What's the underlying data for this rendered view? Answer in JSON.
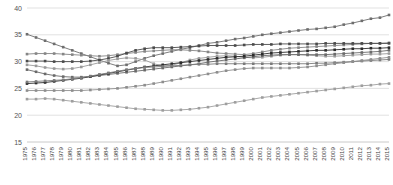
{
  "chart_data": {
    "type": "line",
    "title": "",
    "subtitle": "",
    "xlabel": "",
    "ylabel": "",
    "ylim": [
      15,
      40
    ],
    "yticks": [
      15,
      20,
      25,
      30,
      35,
      40
    ],
    "ytick_labels": [
      "15",
      "20",
      "25",
      "30",
      "35",
      "40"
    ],
    "grid": true,
    "legend": "none",
    "x": [
      1975,
      1976,
      1977,
      1978,
      1979,
      1980,
      1981,
      1982,
      1983,
      1984,
      1985,
      1986,
      1987,
      1988,
      1989,
      1990,
      1991,
      1992,
      1993,
      1994,
      1995,
      1996,
      1997,
      1998,
      1999,
      2000,
      2001,
      2002,
      2003,
      2004,
      2005,
      2006,
      2007,
      2008,
      2009,
      2010,
      2011,
      2012,
      2013,
      2014,
      2015
    ],
    "xtick_labels": [
      "1975",
      "1976",
      "1977",
      "1978",
      "1979",
      "1980",
      "1981",
      "1982",
      "1983",
      "1984",
      "1985",
      "1986",
      "1987",
      "1988",
      "1989",
      "1990",
      "1991",
      "1992",
      "1993",
      "1994",
      "1995",
      "1996",
      "1997",
      "1998",
      "1999",
      "2000",
      "2001",
      "2002",
      "2003",
      "2004",
      "2005",
      "2006",
      "2007",
      "2008",
      "2009",
      "2010",
      "2011",
      "2012",
      "2013",
      "2014",
      "2015"
    ],
    "series": [
      {
        "name": "series-1",
        "color": "#6e6e6e",
        "values": [
          35.1,
          34.5,
          33.9,
          33.3,
          32.7,
          32.1,
          31.5,
          30.9,
          30.3,
          29.7,
          29.2,
          29.4,
          30.0,
          30.6,
          31.1,
          31.5,
          31.9,
          32.3,
          32.6,
          33.0,
          33.4,
          33.6,
          33.9,
          34.2,
          34.4,
          34.7,
          35.0,
          35.2,
          35.4,
          35.6,
          35.8,
          36.0,
          36.1,
          36.3,
          36.5,
          36.9,
          37.2,
          37.6,
          38.0,
          38.2,
          38.7
        ]
      },
      {
        "name": "series-2",
        "color": "#858585",
        "values": [
          31.4,
          31.5,
          31.5,
          31.5,
          31.4,
          31.3,
          31.2,
          31.1,
          31.0,
          31.1,
          31.3,
          31.5,
          31.7,
          31.9,
          32.0,
          32.1,
          32.2,
          32.2,
          32.1,
          32.0,
          31.8,
          31.6,
          31.5,
          31.4,
          31.3,
          31.5,
          31.8,
          32.1,
          32.3,
          32.5,
          32.6,
          32.7,
          32.8,
          32.9,
          33.0,
          33.1,
          33.2,
          33.3,
          33.4,
          33.4,
          33.5
        ]
      },
      {
        "name": "series-3",
        "color": "#4a4a4a",
        "values": [
          30.1,
          30.1,
          30.1,
          30.0,
          30.0,
          30.0,
          30.0,
          30.1,
          30.3,
          30.6,
          31.0,
          31.6,
          32.1,
          32.4,
          32.6,
          32.6,
          32.6,
          32.7,
          32.8,
          32.9,
          33.0,
          33.0,
          33.0,
          33.0,
          33.1,
          33.2,
          33.2,
          33.2,
          33.3,
          33.3,
          33.3,
          33.3,
          33.3,
          33.4,
          33.4,
          33.4,
          33.4,
          33.4,
          33.4,
          33.4,
          33.4
        ]
      },
      {
        "name": "series-4",
        "color": "#9a9a9a",
        "values": [
          29.4,
          29.2,
          28.9,
          28.7,
          28.6,
          28.7,
          29.0,
          29.4,
          29.8,
          30.2,
          30.5,
          30.7,
          30.6,
          30.3,
          29.6,
          29.2,
          29.3,
          29.8,
          30.3,
          30.6,
          30.8,
          31.0,
          31.1,
          31.0,
          30.8,
          30.7,
          30.8,
          31.0,
          31.2,
          31.3,
          31.3,
          31.2,
          31.1,
          31.0,
          31.0,
          31.1,
          31.2,
          31.3,
          31.4,
          31.4,
          31.5
        ]
      },
      {
        "name": "series-5",
        "color": "#6a6a6a",
        "values": [
          28.5,
          28.1,
          27.7,
          27.4,
          27.2,
          27.1,
          27.1,
          27.2,
          27.4,
          27.6,
          27.8,
          28.0,
          28.2,
          28.4,
          28.6,
          28.8,
          29.0,
          29.2,
          29.4,
          29.6,
          29.9,
          30.1,
          30.3,
          30.5,
          30.7,
          30.9,
          31.1,
          31.2,
          31.3,
          31.3,
          31.3,
          31.3,
          31.3,
          31.3,
          31.4,
          31.5,
          31.6,
          31.7,
          31.8,
          31.9,
          32.1
        ]
      },
      {
        "name": "series-6",
        "color": "#2b2b2b",
        "values": [
          25.9,
          26.0,
          26.1,
          26.3,
          26.5,
          26.7,
          26.9,
          27.2,
          27.5,
          27.8,
          28.1,
          28.4,
          28.7,
          29.0,
          29.2,
          29.4,
          29.6,
          29.8,
          30.0,
          30.2,
          30.4,
          30.6,
          30.8,
          30.9,
          31.0,
          31.2,
          31.4,
          31.6,
          31.7,
          31.8,
          31.9,
          32.0,
          32.1,
          32.1,
          32.2,
          32.3,
          32.4,
          32.4,
          32.5,
          32.5,
          32.6
        ]
      },
      {
        "name": "series-7",
        "color": "#7a7a7a",
        "values": [
          26.2,
          26.3,
          26.4,
          26.5,
          26.6,
          26.8,
          27.0,
          27.3,
          27.6,
          27.9,
          28.2,
          28.5,
          28.7,
          28.9,
          29.0,
          29.1,
          29.2,
          29.3,
          29.4,
          29.5,
          29.5,
          29.6,
          29.6,
          29.6,
          29.6,
          29.6,
          29.6,
          29.6,
          29.6,
          29.6,
          29.6,
          29.6,
          29.7,
          29.7,
          29.8,
          29.9,
          30.0,
          30.1,
          30.2,
          30.3,
          30.4
        ]
      },
      {
        "name": "series-8",
        "color": "#8e8e8e",
        "values": [
          24.6,
          24.6,
          24.6,
          24.6,
          24.6,
          24.6,
          24.6,
          24.7,
          24.8,
          24.9,
          25.0,
          25.2,
          25.4,
          25.6,
          25.9,
          26.2,
          26.5,
          26.8,
          27.1,
          27.4,
          27.7,
          28.0,
          28.3,
          28.5,
          28.7,
          28.8,
          28.8,
          28.8,
          28.8,
          28.8,
          28.9,
          29.0,
          29.2,
          29.4,
          29.6,
          29.8,
          30.0,
          30.2,
          30.4,
          30.6,
          30.8
        ]
      },
      {
        "name": "series-9",
        "color": "#9e9e9e",
        "values": [
          23.0,
          23.0,
          23.1,
          23.0,
          22.8,
          22.6,
          22.4,
          22.2,
          22.0,
          21.8,
          21.6,
          21.4,
          21.2,
          21.1,
          21.0,
          20.9,
          20.9,
          21.0,
          21.1,
          21.3,
          21.5,
          21.8,
          22.1,
          22.4,
          22.7,
          23.0,
          23.3,
          23.5,
          23.7,
          23.9,
          24.1,
          24.3,
          24.5,
          24.7,
          24.9,
          25.1,
          25.3,
          25.5,
          25.6,
          25.8,
          25.9
        ]
      }
    ]
  },
  "axes": {
    "plot_left": 27,
    "plot_right": 389,
    "plot_top": 8,
    "plot_bottom": 142
  }
}
